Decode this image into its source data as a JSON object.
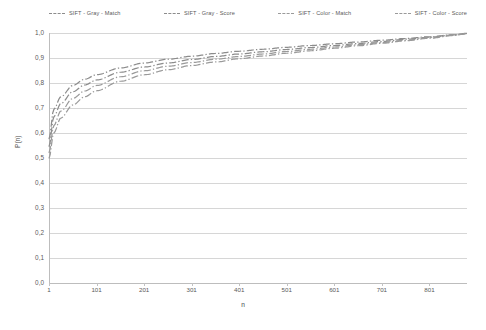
{
  "chart_data": {
    "type": "line",
    "title": "",
    "xlabel": "n",
    "ylabel": "P(n)",
    "xlim": [
      1,
      880
    ],
    "ylim": [
      0,
      1
    ],
    "grid": "horizontal",
    "legend_position": "top",
    "x_ticks": [
      "1",
      "101",
      "201",
      "301",
      "401",
      "501",
      "601",
      "701",
      "801"
    ],
    "x_tick_values": [
      1,
      101,
      201,
      301,
      401,
      501,
      601,
      701,
      801
    ],
    "y_ticks": [
      "0,0",
      "0,1",
      "0,2",
      "0,3",
      "0,4",
      "0,5",
      "0,6",
      "0,7",
      "0,8",
      "0,9",
      "1,0"
    ],
    "y_tick_values": [
      0,
      0.1,
      0.2,
      0.3,
      0.4,
      0.5,
      0.6,
      0.7,
      0.8,
      0.9,
      1.0
    ],
    "x": [
      1,
      11,
      26,
      51,
      76,
      101,
      151,
      201,
      251,
      301,
      351,
      401,
      451,
      501,
      551,
      601,
      651,
      701,
      751,
      801,
      851,
      880
    ],
    "series": [
      {
        "name": "SIFT - Gray - Match",
        "color": "#8c8c8c",
        "dash": "dash-dot",
        "values": [
          0.575,
          0.695,
          0.745,
          0.79,
          0.815,
          0.833,
          0.86,
          0.88,
          0.895,
          0.907,
          0.918,
          0.927,
          0.935,
          0.943,
          0.95,
          0.957,
          0.964,
          0.971,
          0.978,
          0.985,
          0.993,
          0.999
        ]
      },
      {
        "name": "SIFT - Gray - Score",
        "color": "#8c8c8c",
        "dash": "dash-dot",
        "values": [
          0.545,
          0.665,
          0.718,
          0.765,
          0.792,
          0.812,
          0.843,
          0.864,
          0.88,
          0.894,
          0.906,
          0.916,
          0.925,
          0.934,
          0.942,
          0.95,
          0.958,
          0.966,
          0.975,
          0.983,
          0.992,
          0.998
        ]
      },
      {
        "name": "SIFT - Color - Match",
        "color": "#9a9a9a",
        "dash": "dash-dot",
        "values": [
          0.52,
          0.63,
          0.688,
          0.738,
          0.768,
          0.79,
          0.825,
          0.849,
          0.867,
          0.882,
          0.895,
          0.906,
          0.916,
          0.926,
          0.935,
          0.944,
          0.953,
          0.962,
          0.971,
          0.981,
          0.991,
          0.998
        ]
      },
      {
        "name": "SIFT - Color - Score",
        "color": "#9a9a9a",
        "dash": "dash-dot",
        "values": [
          0.498,
          0.6,
          0.66,
          0.712,
          0.745,
          0.769,
          0.807,
          0.833,
          0.853,
          0.87,
          0.884,
          0.897,
          0.908,
          0.919,
          0.929,
          0.939,
          0.949,
          0.959,
          0.969,
          0.979,
          0.99,
          0.997
        ]
      }
    ]
  },
  "axes": {
    "ylabel": "P(n)",
    "xlabel": "n"
  }
}
